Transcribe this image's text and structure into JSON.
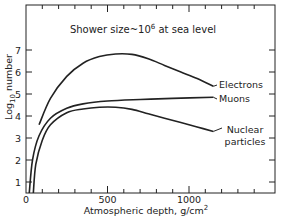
{
  "chart_data": {
    "type": "line",
    "title_main": "Shower size~10",
    "title_exp": "6",
    "title_tail": " at sea level",
    "xlabel": "Atmospheric depth, g/cm",
    "xlabel_sup": "2",
    "ylabel": "Log",
    "ylabel_sub": "10",
    "ylabel_tail": " number",
    "xlim": [
      0,
      1400
    ],
    "ylim": [
      0,
      8
    ],
    "x_ticks": [
      0,
      500,
      1000
    ],
    "x_tick_labels": [
      "0",
      "500",
      "1000"
    ],
    "y_ticks": [
      1,
      2,
      3,
      4,
      5,
      6,
      7
    ],
    "y_tick_labels": [
      "1",
      "2",
      "3",
      "4",
      "5",
      "6",
      "7"
    ],
    "grid": false,
    "legend_position": "inline labels at right end of curves",
    "series": [
      {
        "name": "Electrons",
        "x": [
          80,
          150,
          250,
          350,
          450,
          550,
          650,
          750,
          850,
          950,
          1050,
          1150
        ],
        "values": [
          3.6,
          4.8,
          5.8,
          6.4,
          6.7,
          6.82,
          6.8,
          6.6,
          6.3,
          6.0,
          5.7,
          5.35
        ]
      },
      {
        "name": "Muons",
        "x": [
          20,
          40,
          80,
          150,
          250,
          350,
          500,
          700,
          900,
          1150
        ],
        "values": [
          0.5,
          2.0,
          3.1,
          3.9,
          4.35,
          4.55,
          4.68,
          4.75,
          4.8,
          4.85
        ]
      },
      {
        "name": "Nuclear particles",
        "x": [
          45,
          60,
          100,
          150,
          250,
          350,
          450,
          550,
          650,
          750,
          850,
          950,
          1050,
          1150
        ],
        "values": [
          0.5,
          1.8,
          2.9,
          3.6,
          4.15,
          4.32,
          4.4,
          4.4,
          4.3,
          4.1,
          3.9,
          3.7,
          3.5,
          3.3
        ]
      }
    ],
    "series_labels": [
      "Electrons",
      "Muons",
      "Nuclear",
      "particles"
    ]
  }
}
